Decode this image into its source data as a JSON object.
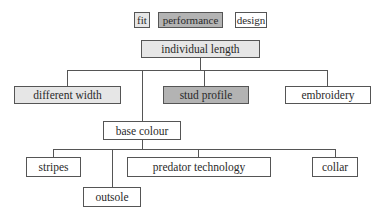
{
  "legend": [
    {
      "label": "fit",
      "color": "#e6e6e6"
    },
    {
      "label": "performance",
      "color": "#b3b3b3"
    },
    {
      "label": "design",
      "color": "#ffffff"
    }
  ],
  "nodes": {
    "root": {
      "label": "individual length",
      "category": "fit"
    },
    "different_width": {
      "label": "different width",
      "category": "fit"
    },
    "stud_profile": {
      "label": "stud profile",
      "category": "performance"
    },
    "embroidery": {
      "label": "embroidery",
      "category": "design"
    },
    "base_colour": {
      "label": "base colour",
      "category": "design"
    },
    "stripes": {
      "label": "stripes",
      "category": "design"
    },
    "outsole": {
      "label": "outsole",
      "category": "design"
    },
    "predator_technology": {
      "label": "predator technology",
      "category": "design"
    },
    "collar": {
      "label": "collar",
      "category": "design"
    }
  },
  "edges": [
    [
      "individual length",
      "different width"
    ],
    [
      "individual length",
      "stud profile"
    ],
    [
      "individual length",
      "embroidery"
    ],
    [
      "individual length",
      "base colour"
    ],
    [
      "base colour",
      "stripes"
    ],
    [
      "base colour",
      "outsole"
    ],
    [
      "base colour",
      "predator technology"
    ],
    [
      "base colour",
      "collar"
    ]
  ]
}
